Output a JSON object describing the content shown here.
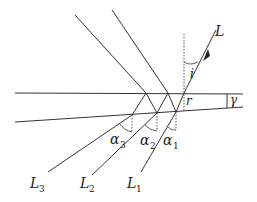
{
  "diagram": {
    "type": "thin wedge multiple reflection/refraction",
    "colors": {
      "line": "#333333",
      "dotted": "#555555",
      "background": "#ffffff"
    },
    "labels": {
      "incident": "L",
      "incidence_angle": "i",
      "refraction_angle": "r",
      "wedge_angle": "γ",
      "alpha1": "α",
      "alpha1_sub": "1",
      "alpha2": "α",
      "alpha2_sub": "2",
      "alpha3": "α",
      "alpha3_sub": "3",
      "L1": "L",
      "L1_sub": "1",
      "L2": "L",
      "L2_sub": "2",
      "L3": "L",
      "L3_sub": "3"
    }
  }
}
